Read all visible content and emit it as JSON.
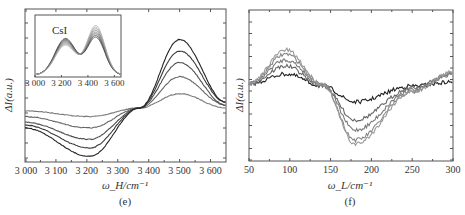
{
  "chart_data": [
    {
      "type": "line",
      "panel": "(e)",
      "title": "",
      "xlabel": "ω_H/cm⁻¹",
      "ylabel": "ΔI(a.u.)",
      "xlim": [
        3000,
        3650
      ],
      "xticks": [
        3000,
        3100,
        3200,
        3300,
        3400,
        3500,
        3600
      ],
      "xtick_labels": [
        "3 000",
        "3 100",
        "3 200",
        "3 300",
        "3 400",
        "3 500",
        "3 600"
      ],
      "grid": false,
      "legend": null,
      "description": "Difference spectra: negative trough near 3210 cm⁻¹, isosbestic crossing near 3370 cm⁻¹, positive peak near 3500 cm⁻¹; 5 curves of increasing amplitude",
      "series": [
        {
          "name": "curve 1",
          "x": [
            3000,
            3210,
            3370,
            3500,
            3650
          ],
          "values": [
            -0.05,
            -0.15,
            0.0,
            0.25,
            0.0
          ]
        },
        {
          "name": "curve 2",
          "x": [
            3000,
            3210,
            3370,
            3500,
            3650
          ],
          "values": [
            -0.15,
            -0.35,
            0.0,
            0.55,
            0.05
          ]
        },
        {
          "name": "curve 3",
          "x": [
            3000,
            3210,
            3370,
            3500,
            3650
          ],
          "values": [
            -0.25,
            -0.55,
            0.0,
            0.8,
            0.05
          ]
        },
        {
          "name": "curve 4",
          "x": [
            3000,
            3210,
            3370,
            3500,
            3650
          ],
          "values": [
            -0.3,
            -0.7,
            0.0,
            1.0,
            0.1
          ]
        },
        {
          "name": "curve 5",
          "x": [
            3000,
            3210,
            3370,
            3500,
            3650
          ],
          "values": [
            -0.35,
            -0.85,
            0.0,
            1.2,
            0.1
          ]
        }
      ],
      "inset": {
        "label": "CsI",
        "xlim": [
          3000,
          3650
        ],
        "xtick_labels": [
          "3 000",
          "3 200",
          "3 400",
          "3 600"
        ],
        "description": "Raw spectra with shoulder near 3230 cm⁻¹ and main peak near 3460 cm⁻¹; 8 curves"
      }
    },
    {
      "type": "line",
      "panel": "(f)",
      "title": "",
      "xlabel": "ω_L/cm⁻¹",
      "ylabel": "ΔI(a.u.)",
      "xlim": [
        50,
        300
      ],
      "xticks": [
        50,
        100,
        150,
        200,
        250,
        300
      ],
      "xtick_labels": [
        "50",
        "100",
        "150",
        "200",
        "250",
        "300"
      ],
      "grid": false,
      "legend": null,
      "description": "Noisy difference spectra: positive band 60–130 cm⁻¹, negative trough near 180 cm⁻¹, recovering toward 300 cm⁻¹; 5 curves",
      "series": [
        {
          "name": "curve 1",
          "x": [
            50,
            95,
            140,
            180,
            250,
            300
          ],
          "values": [
            0.1,
            0.35,
            0.05,
            -0.35,
            0.05,
            0.15
          ]
        },
        {
          "name": "curve 2",
          "x": [
            50,
            95,
            140,
            180,
            250,
            300
          ],
          "values": [
            0.1,
            0.55,
            0.05,
            -0.8,
            0.0,
            0.35
          ]
        },
        {
          "name": "curve 3",
          "x": [
            50,
            95,
            140,
            180,
            250,
            300
          ],
          "values": [
            0.1,
            0.7,
            0.1,
            -1.05,
            -0.05,
            0.35
          ]
        },
        {
          "name": "curve 4",
          "x": [
            50,
            95,
            140,
            180,
            250,
            300
          ],
          "values": [
            0.1,
            0.85,
            0.1,
            -1.3,
            -0.1,
            0.4
          ]
        },
        {
          "name": "curve 5",
          "x": [
            50,
            95,
            140,
            180,
            250,
            300
          ],
          "values": [
            0.1,
            0.95,
            0.1,
            -1.4,
            -0.1,
            0.4
          ]
        }
      ]
    }
  ]
}
